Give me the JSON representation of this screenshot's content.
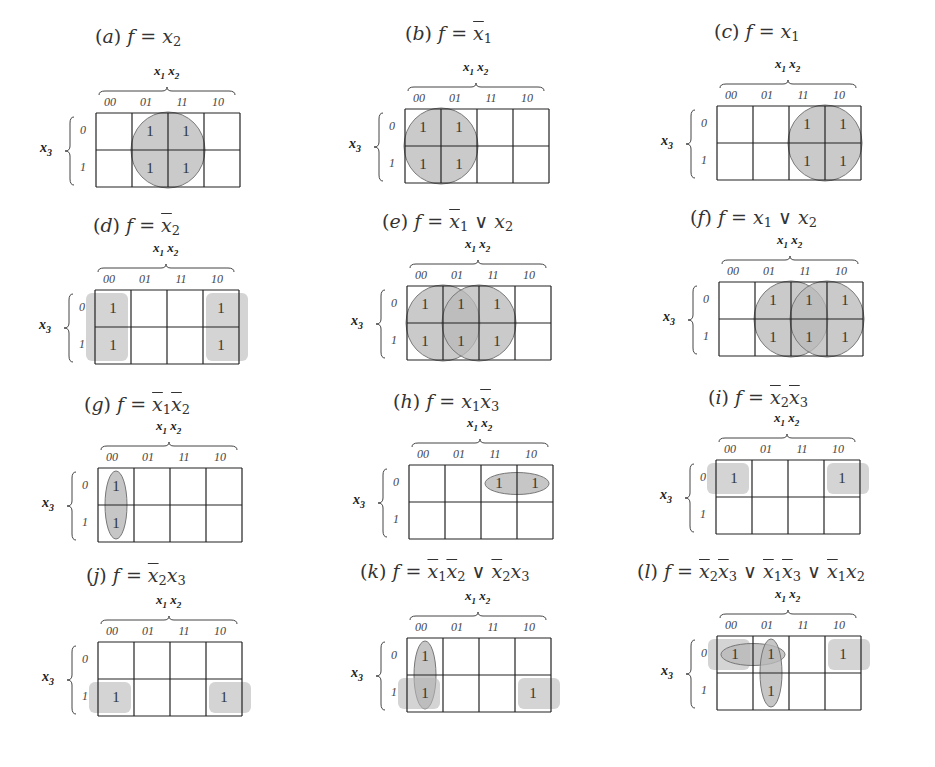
{
  "figure": {
    "column_variable_label": "x1 x2",
    "row_variable_label": "x3",
    "column_codes": [
      "00",
      "01",
      "11",
      "10"
    ],
    "row_codes": [
      "0",
      "1"
    ],
    "one_symbol": "1",
    "shade_color": "#b8b8b8",
    "grid_color": "#222222"
  },
  "panels": [
    {
      "id": "a",
      "label": "(a)",
      "formula_text": "f = x2",
      "ones": [
        [
          0,
          1
        ],
        [
          0,
          2
        ],
        [
          1,
          1
        ],
        [
          1,
          2
        ]
      ],
      "groups": [
        {
          "shape": "circle",
          "cells": [
            [
              0,
              1
            ],
            [
              0,
              2
            ],
            [
              1,
              1
            ],
            [
              1,
              2
            ]
          ]
        }
      ]
    },
    {
      "id": "b",
      "label": "(b)",
      "formula_text": "f = x̄1",
      "ones": [
        [
          0,
          0
        ],
        [
          0,
          1
        ],
        [
          1,
          0
        ],
        [
          1,
          1
        ]
      ],
      "groups": [
        {
          "shape": "circle",
          "cells": [
            [
              0,
              0
            ],
            [
              0,
              1
            ],
            [
              1,
              0
            ],
            [
              1,
              1
            ]
          ]
        }
      ]
    },
    {
      "id": "c",
      "label": "(c)",
      "formula_text": "f = x1",
      "ones": [
        [
          0,
          2
        ],
        [
          0,
          3
        ],
        [
          1,
          2
        ],
        [
          1,
          3
        ]
      ],
      "groups": [
        {
          "shape": "circle",
          "cells": [
            [
              0,
              2
            ],
            [
              0,
              3
            ],
            [
              1,
              2
            ],
            [
              1,
              3
            ]
          ]
        }
      ]
    },
    {
      "id": "d",
      "label": "(d)",
      "formula_text": "f = x̄2",
      "ones": [
        [
          0,
          0
        ],
        [
          1,
          0
        ],
        [
          0,
          3
        ],
        [
          1,
          3
        ]
      ],
      "groups": [
        {
          "shape": "wrap-rect",
          "cells": [
            [
              0,
              0
            ],
            [
              1,
              0
            ],
            [
              0,
              3
            ],
            [
              1,
              3
            ]
          ]
        }
      ]
    },
    {
      "id": "e",
      "label": "(e)",
      "formula_text": "f = x̄1 ∨ x2",
      "ones": [
        [
          0,
          0
        ],
        [
          0,
          1
        ],
        [
          0,
          2
        ],
        [
          1,
          0
        ],
        [
          1,
          1
        ],
        [
          1,
          2
        ]
      ],
      "groups": [
        {
          "shape": "circle",
          "cells": [
            [
              0,
              0
            ],
            [
              0,
              1
            ],
            [
              1,
              0
            ],
            [
              1,
              1
            ]
          ]
        },
        {
          "shape": "circle",
          "cells": [
            [
              0,
              1
            ],
            [
              0,
              2
            ],
            [
              1,
              1
            ],
            [
              1,
              2
            ]
          ]
        }
      ]
    },
    {
      "id": "f",
      "label": "(f)",
      "formula_text": "f = x1 ∨ x2",
      "ones": [
        [
          0,
          1
        ],
        [
          0,
          2
        ],
        [
          0,
          3
        ],
        [
          1,
          1
        ],
        [
          1,
          2
        ],
        [
          1,
          3
        ]
      ],
      "groups": [
        {
          "shape": "circle",
          "cells": [
            [
              0,
              1
            ],
            [
              0,
              2
            ],
            [
              1,
              1
            ],
            [
              1,
              2
            ]
          ]
        },
        {
          "shape": "circle",
          "cells": [
            [
              0,
              2
            ],
            [
              0,
              3
            ],
            [
              1,
              2
            ],
            [
              1,
              3
            ]
          ]
        }
      ]
    },
    {
      "id": "g",
      "label": "(g)",
      "formula_text": "f = x̄1x̄2",
      "ones": [
        [
          0,
          0
        ],
        [
          1,
          0
        ]
      ],
      "groups": [
        {
          "shape": "ellipse-vertical",
          "cells": [
            [
              0,
              0
            ],
            [
              1,
              0
            ]
          ]
        }
      ]
    },
    {
      "id": "h",
      "label": "(h)",
      "formula_text": "f = x1x̄3",
      "ones": [
        [
          0,
          2
        ],
        [
          0,
          3
        ]
      ],
      "groups": [
        {
          "shape": "ellipse-horizontal",
          "cells": [
            [
              0,
              2
            ],
            [
              0,
              3
            ]
          ]
        }
      ]
    },
    {
      "id": "i",
      "label": "(i)",
      "formula_text": "f = x̄2x̄3",
      "ones": [
        [
          0,
          0
        ],
        [
          0,
          3
        ]
      ],
      "groups": [
        {
          "shape": "wrap-rect",
          "cells": [
            [
              0,
              0
            ],
            [
              0,
              3
            ]
          ]
        }
      ]
    },
    {
      "id": "j",
      "label": "(j)",
      "formula_text": "f = x̄2x3",
      "ones": [
        [
          1,
          0
        ],
        [
          1,
          3
        ]
      ],
      "groups": [
        {
          "shape": "wrap-rect",
          "cells": [
            [
              1,
              0
            ],
            [
              1,
              3
            ]
          ]
        }
      ]
    },
    {
      "id": "k",
      "label": "(k)",
      "formula_text": "f = x̄1x̄2 ∨ x̄2x3",
      "ones": [
        [
          0,
          0
        ],
        [
          1,
          0
        ],
        [
          1,
          3
        ]
      ],
      "groups": [
        {
          "shape": "ellipse-vertical",
          "cells": [
            [
              0,
              0
            ],
            [
              1,
              0
            ]
          ]
        },
        {
          "shape": "wrap-rect",
          "cells": [
            [
              1,
              0
            ],
            [
              1,
              3
            ]
          ]
        }
      ]
    },
    {
      "id": "l",
      "label": "(l)",
      "formula_text": "f = x̄2x̄3 ∨ x̄1x̄3 ∨ x̄1x2",
      "ones": [
        [
          0,
          0
        ],
        [
          0,
          1
        ],
        [
          0,
          3
        ],
        [
          1,
          1
        ]
      ],
      "groups": [
        {
          "shape": "wrap-rect",
          "cells": [
            [
              0,
              0
            ],
            [
              0,
              3
            ]
          ]
        },
        {
          "shape": "ellipse-horizontal",
          "cells": [
            [
              0,
              0
            ],
            [
              0,
              1
            ]
          ]
        },
        {
          "shape": "ellipse-vertical",
          "cells": [
            [
              0,
              1
            ],
            [
              1,
              1
            ]
          ]
        }
      ]
    }
  ]
}
